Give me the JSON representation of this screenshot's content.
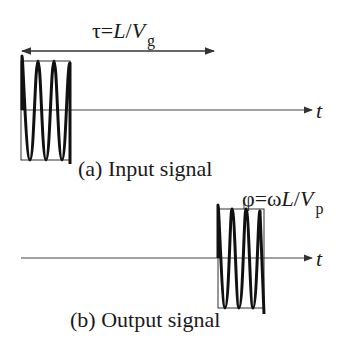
{
  "figure": {
    "panel_a": {
      "caption": "(a) Input signal",
      "delay_label_prefix": "τ=",
      "delay_label_L": "L",
      "delay_label_slash": "/",
      "delay_label_V": "V",
      "delay_label_sub": "g",
      "axis_label": "t"
    },
    "panel_b": {
      "caption": "(b) Output signal",
      "phase_label_prefix": "φ=ω",
      "phase_label_L": "L",
      "phase_label_slash": "/",
      "phase_label_V": "V",
      "phase_label_sub": "p",
      "axis_label": "t"
    },
    "colors": {
      "ink": "#1a1a1a",
      "axis": "#333333",
      "background": "#ffffff"
    }
  }
}
